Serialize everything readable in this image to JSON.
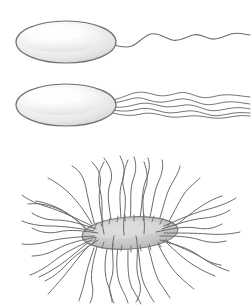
{
  "figure": {
    "title": "Bacterial flagellar arrangements",
    "background_color": "#ffffff",
    "width": 251,
    "height": 305,
    "line_color": "#6b6b6b",
    "cell_outline_color": "#6f6f6f",
    "cell_fill_light": "#f1f1f1",
    "cell_fill_gray": "#c9c9c9",
    "panels": [
      {
        "id": "panel-monotrichous",
        "label": "",
        "arrangement": "monotrichous",
        "flagella_count": 1,
        "cell": {
          "shape": "ellipse",
          "cx": 66,
          "cy": 42,
          "rx": 50,
          "ry": 21,
          "fill": "#f1f1f1",
          "stroke": "#6f6f6f"
        }
      },
      {
        "id": "panel-lophotrichous",
        "label": "",
        "arrangement": "lophotrichous",
        "flagella_count": 5,
        "cell": {
          "shape": "ellipse",
          "cx": 66,
          "cy": 105,
          "rx": 50,
          "ry": 21,
          "fill": "#f1f1f1",
          "stroke": "#6f6f6f"
        }
      },
      {
        "id": "panel-peritrichous",
        "label": "",
        "arrangement": "peritrichous",
        "flagella_count": 44,
        "cell": {
          "shape": "ellipse",
          "cx": 130,
          "cy": 233,
          "rx": 48,
          "ry": 16,
          "fill": "#c9c9c9",
          "stroke": "#7a7a7a",
          "rotation_deg": -4
        }
      }
    ]
  }
}
